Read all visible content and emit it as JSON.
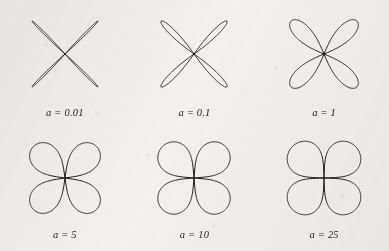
{
  "figure": {
    "background_color": "#f3f2f0",
    "stroke_color": "#201e1c",
    "columns": 3,
    "rows": 2
  },
  "chart_data": {
    "type": "line",
    "title": "",
    "xlabel": "",
    "ylabel": "",
    "grid": false,
    "legend": null,
    "coordinate_system": "polar",
    "petal_count": 4,
    "panels": [
      {
        "label": "a = 0.01",
        "parameter_name": "a",
        "parameter_value": 0.01,
        "petal_half_width_deg": 3.0,
        "radius_px": 50,
        "orientation_deg": 45,
        "description": "four extremely narrow petals forming an X"
      },
      {
        "label": "a = 0.1",
        "parameter_name": "a",
        "parameter_value": 0.1,
        "petal_half_width_deg": 9.5,
        "radius_px": 50,
        "orientation_deg": 45,
        "description": "four narrow lens-shaped petals forming an X"
      },
      {
        "label": "a = 1",
        "parameter_name": "a",
        "parameter_value": 1,
        "petal_half_width_deg": 22.5,
        "radius_px": 50,
        "orientation_deg": 45,
        "description": "four broad rounded petals, classic four-leaf rose"
      },
      {
        "label": "a = 5",
        "parameter_name": "a",
        "parameter_value": 5,
        "petal_half_width_deg": 37.0,
        "radius_px": 48,
        "orientation_deg": 45,
        "description": "four wide petals nearly filling each quadrant"
      },
      {
        "label": "a = 10",
        "parameter_name": "a",
        "parameter_value": 10,
        "petal_half_width_deg": 40.5,
        "radius_px": 48,
        "orientation_deg": 45,
        "description": "four quadrant-filling petals with small notches on the axes"
      },
      {
        "label": "a = 25",
        "parameter_name": "a",
        "parameter_value": 25,
        "petal_half_width_deg": 43.0,
        "radius_px": 48,
        "orientation_deg": 45,
        "description": "four petals merging into a near circle split by a cross"
      }
    ]
  }
}
